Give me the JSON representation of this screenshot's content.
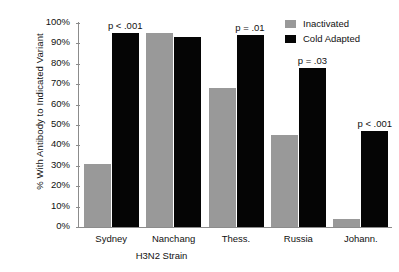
{
  "chart_data": {
    "type": "bar",
    "title": "",
    "xlabel": "H3N2 Strain",
    "ylabel": "% With Antibody to Indicated Variant",
    "categories": [
      "Sydney",
      "Nanchang",
      "Thess.",
      "Russia",
      "Johann."
    ],
    "ylim": [
      0,
      100
    ],
    "yticks": [
      "0%",
      "10%",
      "20%",
      "30%",
      "40%",
      "50%",
      "60%",
      "70%",
      "80%",
      "90%",
      "100%"
    ],
    "ytick_values": [
      0,
      10,
      20,
      30,
      40,
      50,
      60,
      70,
      80,
      90,
      100
    ],
    "grid": false,
    "legend_position": "top-right",
    "series": [
      {
        "name": "Inactivated",
        "color": "#999999",
        "values": [
          31,
          95,
          68,
          45,
          4
        ]
      },
      {
        "name": "Cold Adapted",
        "color": "#050505",
        "values": [
          95,
          93,
          94,
          78,
          47
        ]
      }
    ],
    "annotations": [
      {
        "category": "Sydney",
        "text": "p < .001"
      },
      {
        "category": "Nanchang",
        "text": ""
      },
      {
        "category": "Thess.",
        "text": "p = .01"
      },
      {
        "category": "Russia",
        "text": "p = .03"
      },
      {
        "category": "Johann.",
        "text": "p < .001"
      }
    ]
  }
}
